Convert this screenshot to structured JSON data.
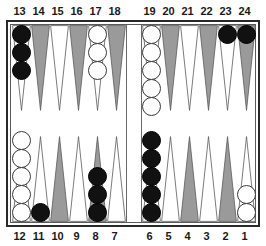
{
  "app": {
    "title": "Backgammon Board",
    "board_type": "backgammon"
  },
  "colors": {
    "point_light": "#ffffff",
    "point_dark": "#9a9a9a",
    "point_outline": "#5a5a5a",
    "checker_black": "#111111",
    "checker_white": "#ffffff",
    "frame": "#2a2a2a",
    "background": "#ffffff",
    "label_text": "#1a1a1a"
  },
  "labels": {
    "top": [
      "13",
      "14",
      "15",
      "16",
      "17",
      "18",
      "19",
      "20",
      "21",
      "22",
      "23",
      "24"
    ],
    "bottom": [
      "12",
      "11",
      "10",
      "9",
      "8",
      "7",
      "6",
      "5",
      "4",
      "3",
      "2",
      "1"
    ]
  },
  "chart_data": {
    "type": "table",
    "xlabel": "Point number",
    "ylabel": "Checkers",
    "legend": [
      "black",
      "white"
    ],
    "categories": [
      "1",
      "2",
      "3",
      "4",
      "5",
      "6",
      "7",
      "8",
      "9",
      "10",
      "11",
      "12",
      "13",
      "14",
      "15",
      "16",
      "17",
      "18",
      "19",
      "20",
      "21",
      "22",
      "23",
      "24"
    ],
    "series": [
      {
        "name": "black",
        "values": [
          0,
          0,
          0,
          0,
          0,
          5,
          0,
          3,
          0,
          0,
          1,
          0,
          3,
          0,
          0,
          0,
          0,
          0,
          0,
          0,
          0,
          0,
          1,
          1
        ]
      },
      {
        "name": "white",
        "values": [
          2,
          0,
          0,
          0,
          0,
          0,
          0,
          0,
          0,
          0,
          0,
          5,
          0,
          0,
          0,
          0,
          3,
          0,
          5,
          0,
          0,
          0,
          0,
          0
        ]
      }
    ]
  },
  "points": [
    {
      "id": "point-13",
      "number": "13",
      "row": "top",
      "quadrant": "top-left",
      "slot": 0,
      "shade": "light",
      "checker_color": "black",
      "count": 3
    },
    {
      "id": "point-14",
      "number": "14",
      "row": "top",
      "quadrant": "top-left",
      "slot": 1,
      "shade": "dark",
      "checker_color": "none",
      "count": 0
    },
    {
      "id": "point-15",
      "number": "15",
      "row": "top",
      "quadrant": "top-left",
      "slot": 2,
      "shade": "light",
      "checker_color": "none",
      "count": 0
    },
    {
      "id": "point-16",
      "number": "16",
      "row": "top",
      "quadrant": "top-left",
      "slot": 3,
      "shade": "dark",
      "checker_color": "none",
      "count": 0
    },
    {
      "id": "point-17",
      "number": "17",
      "row": "top",
      "quadrant": "top-left",
      "slot": 4,
      "shade": "light",
      "checker_color": "white",
      "count": 3
    },
    {
      "id": "point-18",
      "number": "18",
      "row": "top",
      "quadrant": "top-left",
      "slot": 5,
      "shade": "dark",
      "checker_color": "none",
      "count": 0
    },
    {
      "id": "point-19",
      "number": "19",
      "row": "top",
      "quadrant": "top-right",
      "slot": 0,
      "shade": "light",
      "checker_color": "white",
      "count": 5
    },
    {
      "id": "point-20",
      "number": "20",
      "row": "top",
      "quadrant": "top-right",
      "slot": 1,
      "shade": "dark",
      "checker_color": "none",
      "count": 0
    },
    {
      "id": "point-21",
      "number": "21",
      "row": "top",
      "quadrant": "top-right",
      "slot": 2,
      "shade": "light",
      "checker_color": "none",
      "count": 0
    },
    {
      "id": "point-22",
      "number": "22",
      "row": "top",
      "quadrant": "top-right",
      "slot": 3,
      "shade": "dark",
      "checker_color": "none",
      "count": 0
    },
    {
      "id": "point-23",
      "number": "23",
      "row": "top",
      "quadrant": "top-right",
      "slot": 4,
      "shade": "light",
      "checker_color": "black",
      "count": 1
    },
    {
      "id": "point-24",
      "number": "24",
      "row": "top",
      "quadrant": "top-right",
      "slot": 5,
      "shade": "dark",
      "checker_color": "black",
      "count": 1
    },
    {
      "id": "point-12",
      "number": "12",
      "row": "bottom",
      "quadrant": "bottom-left",
      "slot": 0,
      "shade": "light",
      "checker_color": "white",
      "count": 5
    },
    {
      "id": "point-11",
      "number": "11",
      "row": "bottom",
      "quadrant": "bottom-left",
      "slot": 1,
      "shade": "light",
      "checker_color": "black",
      "count": 1
    },
    {
      "id": "point-10",
      "number": "10",
      "row": "bottom",
      "quadrant": "bottom-left",
      "slot": 2,
      "shade": "dark",
      "checker_color": "none",
      "count": 0
    },
    {
      "id": "point-9",
      "number": "9",
      "row": "bottom",
      "quadrant": "bottom-left",
      "slot": 3,
      "shade": "light",
      "checker_color": "none",
      "count": 0
    },
    {
      "id": "point-8",
      "number": "8",
      "row": "bottom",
      "quadrant": "bottom-left",
      "slot": 4,
      "shade": "dark",
      "checker_color": "black",
      "count": 3
    },
    {
      "id": "point-7",
      "number": "7",
      "row": "bottom",
      "quadrant": "bottom-left",
      "slot": 5,
      "shade": "light",
      "checker_color": "none",
      "count": 0
    },
    {
      "id": "point-6",
      "number": "6",
      "row": "bottom",
      "quadrant": "bottom-right",
      "slot": 0,
      "shade": "light",
      "checker_color": "black",
      "count": 5
    },
    {
      "id": "point-5",
      "number": "5",
      "row": "bottom",
      "quadrant": "bottom-right",
      "slot": 1,
      "shade": "light",
      "checker_color": "none",
      "count": 0
    },
    {
      "id": "point-4",
      "number": "4",
      "row": "bottom",
      "quadrant": "bottom-right",
      "slot": 2,
      "shade": "dark",
      "checker_color": "none",
      "count": 0
    },
    {
      "id": "point-3",
      "number": "3",
      "row": "bottom",
      "quadrant": "bottom-right",
      "slot": 3,
      "shade": "light",
      "checker_color": "none",
      "count": 0
    },
    {
      "id": "point-2",
      "number": "2",
      "row": "bottom",
      "quadrant": "bottom-right",
      "slot": 4,
      "shade": "dark",
      "checker_color": "none",
      "count": 0
    },
    {
      "id": "point-1",
      "number": "1",
      "row": "bottom",
      "quadrant": "bottom-right",
      "slot": 5,
      "shade": "light",
      "checker_color": "white",
      "count": 2
    }
  ],
  "bar": {
    "black_on_bar": 0,
    "white_on_bar": 0
  }
}
